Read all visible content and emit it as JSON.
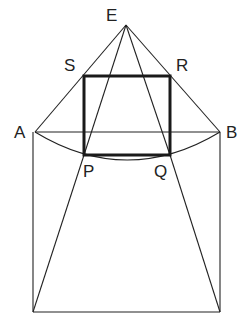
{
  "diagram": {
    "type": "geometry-construction",
    "labels": {
      "E": "E",
      "S": "S",
      "R": "R",
      "A": "A",
      "B": "B",
      "P": "P",
      "Q": "Q"
    },
    "points": {
      "E": [
        126,
        25
      ],
      "S": [
        84,
        76
      ],
      "R": [
        170,
        76
      ],
      "A": [
        35,
        132
      ],
      "B": [
        220,
        132
      ],
      "P": [
        84,
        155
      ],
      "Q": [
        170,
        155
      ],
      "BL": [
        33,
        312
      ],
      "BR": [
        220,
        312
      ]
    },
    "colors": {
      "stroke": "#222222",
      "background": "#ffffff"
    }
  }
}
